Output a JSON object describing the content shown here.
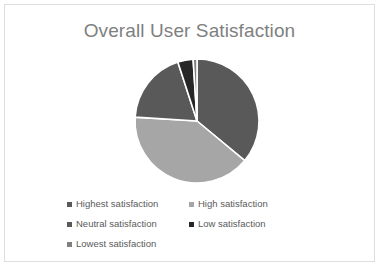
{
  "card": {
    "background": "#ffffff",
    "border_color": "#dedede"
  },
  "chart_data": {
    "type": "pie",
    "title": "Overall User Satisfaction",
    "title_color": "#7f7f7f",
    "legend_position": "bottom",
    "legend_columns": 2,
    "start_angle_deg": 0,
    "direction": "clockwise",
    "slice_gap_color": "#ffffff",
    "categories": [
      "Highest satisfaction",
      "High satisfaction",
      "Neutral satisfaction",
      "Low satisfaction",
      "Lowest satisfaction"
    ],
    "values": [
      36,
      40,
      19,
      4,
      1
    ],
    "colors": [
      "#595959",
      "#a6a6a6",
      "#595959",
      "#262626",
      "#7f7f7f"
    ],
    "slices": [
      {
        "label": "Highest satisfaction",
        "value": 36,
        "color": "#595959"
      },
      {
        "label": "High satisfaction",
        "value": 40,
        "color": "#a6a6a6"
      },
      {
        "label": "Neutral satisfaction",
        "value": 19,
        "color": "#595959"
      },
      {
        "label": "Low satisfaction",
        "value": 4,
        "color": "#262626"
      },
      {
        "label": "Lowest satisfaction",
        "value": 1,
        "color": "#7f7f7f"
      }
    ],
    "xlabel": "",
    "ylabel": ""
  }
}
